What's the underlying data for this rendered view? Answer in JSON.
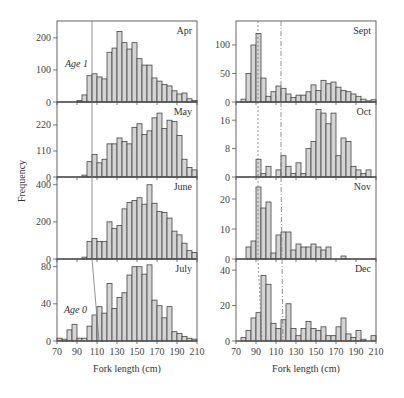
{
  "chart_data": {
    "type": "bar",
    "title": "",
    "xlabel": "Fork length (cm)",
    "ylabel": "Frequency",
    "bin_width": 5,
    "x_ticks": [
      70,
      90,
      110,
      130,
      150,
      170,
      190,
      210
    ],
    "xlim": [
      70,
      210
    ],
    "bin_starts": [
      70,
      75,
      80,
      85,
      90,
      95,
      100,
      105,
      110,
      115,
      120,
      125,
      130,
      135,
      140,
      145,
      150,
      155,
      160,
      165,
      170,
      175,
      180,
      185,
      190,
      195,
      200,
      205
    ],
    "panels": [
      {
        "name": "Apr",
        "column": 0,
        "ylim": [
          0,
          240
        ],
        "yticks": [
          0,
          100,
          200
        ],
        "values": [
          0,
          0,
          0,
          0,
          5,
          22,
          82,
          88,
          78,
          72,
          155,
          168,
          220,
          185,
          165,
          185,
          135,
          115,
          115,
          75,
          65,
          55,
          50,
          35,
          25,
          28,
          10,
          5
        ],
        "annotation": "Age 1"
      },
      {
        "name": "May",
        "column": 0,
        "ylim": [
          0,
          300
        ],
        "yticks": [
          0,
          110,
          220
        ],
        "values": [
          0,
          0,
          0,
          0,
          0,
          8,
          65,
          95,
          60,
          75,
          140,
          140,
          165,
          150,
          140,
          210,
          225,
          180,
          195,
          250,
          270,
          205,
          240,
          235,
          175,
          75,
          40,
          30
        ]
      },
      {
        "name": "June",
        "column": 0,
        "ylim": [
          0,
          420
        ],
        "yticks": [
          0,
          200,
          400
        ],
        "values": [
          0,
          0,
          0,
          0,
          0,
          10,
          95,
          110,
          95,
          95,
          200,
          165,
          180,
          270,
          305,
          315,
          330,
          295,
          400,
          300,
          255,
          250,
          220,
          150,
          130,
          85,
          45,
          35
        ]
      },
      {
        "name": "July",
        "column": 0,
        "ylim": [
          0,
          84
        ],
        "yticks": [
          0,
          40,
          80
        ],
        "values": [
          3,
          2,
          12,
          18,
          3,
          3,
          16,
          28,
          37,
          30,
          62,
          35,
          47,
          52,
          71,
          80,
          80,
          72,
          82,
          44,
          38,
          25,
          37,
          10,
          8,
          5,
          3,
          2
        ],
        "annotation": "Age 0"
      },
      {
        "name": "Sept",
        "column": 1,
        "ylim": [
          0,
          135
        ],
        "yticks": [
          0,
          50,
          100
        ],
        "values": [
          0,
          5,
          50,
          100,
          120,
          42,
          10,
          18,
          28,
          24,
          14,
          8,
          12,
          12,
          18,
          30,
          20,
          38,
          32,
          35,
          26,
          20,
          18,
          14,
          10,
          5,
          2,
          4
        ]
      },
      {
        "name": "Oct",
        "column": 1,
        "ylim": [
          0,
          20
        ],
        "yticks": [
          0,
          8,
          16
        ],
        "values": [
          0,
          0,
          0,
          0,
          5,
          1,
          3,
          0,
          2,
          6,
          3,
          1,
          4,
          1,
          8,
          10,
          19,
          18,
          15,
          18,
          6,
          11,
          10,
          3,
          2,
          1,
          2,
          0
        ]
      },
      {
        "name": "Nov",
        "column": 1,
        "ylim": [
          0,
          26
        ],
        "yticks": [
          0,
          10,
          20
        ],
        "values": [
          0,
          0,
          4,
          6,
          24,
          17,
          19,
          2,
          8,
          9,
          9,
          3,
          5,
          4,
          4,
          5,
          4,
          3,
          4,
          0,
          0,
          1,
          0,
          0,
          0,
          0,
          0,
          0
        ]
      },
      {
        "name": "Dec",
        "column": 1,
        "ylim": [
          0,
          44
        ],
        "yticks": [
          0,
          20,
          40
        ],
        "values": [
          0,
          2,
          6,
          13,
          16,
          37,
          32,
          10,
          7,
          12,
          21,
          7,
          3,
          7,
          11,
          7,
          6,
          8,
          3,
          3,
          8,
          13,
          4,
          2,
          6,
          1,
          0,
          3
        ]
      }
    ],
    "guide_lines": {
      "left_column": [
        [
          105,
          105,
          105,
          112
        ]
      ],
      "right_column": [
        [
          92,
          92,
          92,
          96
        ],
        [
          115,
          115,
          116,
          117
        ]
      ]
    },
    "legend": "none",
    "grid": false
  },
  "labels": {
    "xlabel_left": "Fork length (cm)",
    "xlabel_right": "Fork length (cm)",
    "ylabel": "Frequency"
  }
}
